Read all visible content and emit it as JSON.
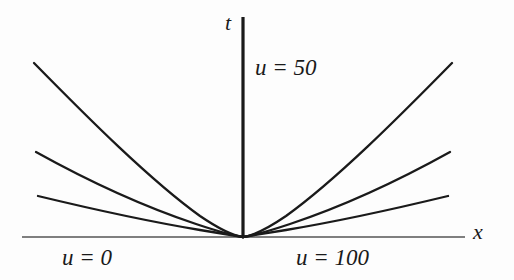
{
  "figure": {
    "background_color": "#fdfdfd",
    "ink_color": "#1a1a1a",
    "axis_color": "#555555",
    "labels": {
      "t_axis": "t",
      "x_axis": "x",
      "u_center": "u = 50",
      "u_left": "u = 0",
      "u_right": "u = 100"
    }
  },
  "chart_data": {
    "type": "line",
    "title": "",
    "subtitle": "",
    "xlabel": "x",
    "ylabel": "t",
    "grid": false,
    "legend": null,
    "origin_px": [
      243,
      237
    ],
    "xlim": [
      22,
      465
    ],
    "ylim": [
      17,
      237
    ],
    "annotations": [
      {
        "text": "u = 50",
        "x_px": 255,
        "y_px": 58
      },
      {
        "text": "u = 0",
        "x_px": 62,
        "y_px": 248
      },
      {
        "text": "u = 100",
        "x_px": 296,
        "y_px": 248
      },
      {
        "text": "t",
        "x_px": 226,
        "y_px": 14
      },
      {
        "text": "x",
        "x_px": 474,
        "y_px": 224
      }
    ],
    "axes": [
      {
        "name": "t-axis",
        "orientation": "vertical",
        "x_px": 243,
        "y_start_px": 17,
        "y_end_px": 237
      },
      {
        "name": "x-axis",
        "orientation": "horizontal",
        "y_px": 237,
        "x_start_px": 22,
        "x_end_px": 465
      }
    ],
    "series": [
      {
        "name": "left-steep",
        "side": "left",
        "path": "M34,63 C88,118 150,180 200,216 C222,231 236,236 243,237"
      },
      {
        "name": "left-medium",
        "side": "left",
        "path": "M36,152 C90,182 148,208 196,224 C220,232 236,236 243,237"
      },
      {
        "name": "left-shallow",
        "side": "left",
        "path": "M38,196 C96,210 152,222 200,230 C224,234 237,236 243,237"
      },
      {
        "name": "right-steep",
        "side": "right",
        "path": "M452,63 C398,118 336,180 286,216 C264,231 250,236 243,237"
      },
      {
        "name": "right-medium",
        "side": "right",
        "path": "M450,152 C396,182 338,208 290,224 C266,232 250,236 243,237"
      },
      {
        "name": "right-shallow",
        "side": "right",
        "path": "M448,196 C390,210 334,222 286,230 C262,234 249,236 243,237"
      }
    ]
  }
}
